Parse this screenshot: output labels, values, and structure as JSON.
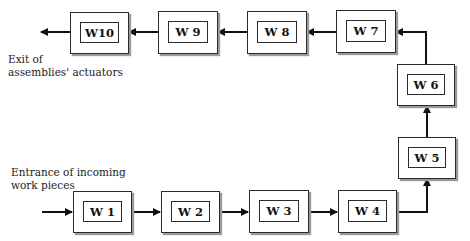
{
  "diagram": {
    "type": "process-flow",
    "labels": {
      "exit": [
        "Exit of",
        "assemblies' actuators"
      ],
      "entrance": [
        "Entrance of incoming",
        "work pieces"
      ]
    },
    "workstations": [
      {
        "id": "W1",
        "label": "W 1"
      },
      {
        "id": "W2",
        "label": "W 2"
      },
      {
        "id": "W3",
        "label": "W 3"
      },
      {
        "id": "W4",
        "label": "W 4"
      },
      {
        "id": "W5",
        "label": "W 5"
      },
      {
        "id": "W6",
        "label": "W 6"
      },
      {
        "id": "W7",
        "label": "W 7"
      },
      {
        "id": "W8",
        "label": "W 8"
      },
      {
        "id": "W9",
        "label": "W 9"
      },
      {
        "id": "W10",
        "label": "W10"
      }
    ],
    "flow": [
      "Entrance",
      "W1",
      "W2",
      "W3",
      "W4",
      "W5",
      "W6",
      "W7",
      "W8",
      "W9",
      "W10",
      "Exit"
    ],
    "colors": {
      "stroke": "#2a2a2a",
      "shadow": "#9a9a9a",
      "background": "#ffffff"
    }
  }
}
